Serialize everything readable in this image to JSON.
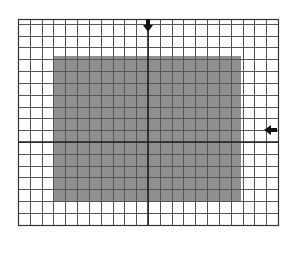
{
  "diagram": {
    "type": "grid-with-region",
    "grid": {
      "left": 18,
      "top": 19,
      "right": 278,
      "bottom": 225,
      "columns": 22,
      "cell_size": 11.82,
      "line_color": "#555555",
      "border_color": "#333333",
      "center_line_x": 148,
      "center_line_y": 142,
      "center_line_color": "#222222"
    },
    "region": {
      "left": 53,
      "top": 56,
      "right": 241,
      "bottom": 202,
      "fill_color": "#8f8f8f"
    },
    "markers": [
      {
        "name": "top-marker",
        "direction": "down",
        "x": 148,
        "y": 25,
        "color": "#111111"
      },
      {
        "name": "right-marker",
        "direction": "left",
        "x": 271,
        "y": 130,
        "color": "#111111"
      }
    ]
  }
}
